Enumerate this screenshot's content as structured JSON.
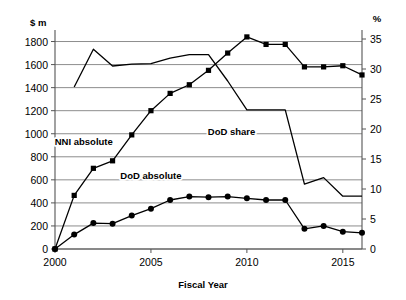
{
  "chart_data": {
    "type": "line",
    "title": "",
    "xlabel": "Fiscal Year",
    "ylabel_left": "$ m",
    "ylabel_right": "%",
    "x": [
      2000,
      2001,
      2002,
      2003,
      2004,
      2005,
      2006,
      2007,
      2008,
      2009,
      2010,
      2011,
      2012,
      2013,
      2014,
      2015,
      2016
    ],
    "xlim": [
      2000,
      2016
    ],
    "xticks": [
      2000,
      2005,
      2010,
      2015
    ],
    "xtick_labels": [
      "2000",
      "2005",
      "2010",
      "2015"
    ],
    "ylim_left": [
      0,
      1900
    ],
    "yticks_left": [
      0,
      200,
      400,
      600,
      800,
      1000,
      1200,
      1400,
      1600,
      1800
    ],
    "ytick_labels_left": [
      "0",
      "200",
      "400",
      "600",
      "800",
      "1000",
      "1200",
      "1400",
      "1600",
      "1800"
    ],
    "ylim_right": [
      0,
      36.5
    ],
    "yticks_right": [
      0,
      5,
      10,
      15,
      20,
      25,
      30,
      35
    ],
    "ytick_labels_right": [
      "0",
      "5",
      "10",
      "15",
      "20",
      "25",
      "30",
      "35"
    ],
    "grid": true,
    "grid_axis": "y-left",
    "legend_position": "inline-annotations",
    "series": [
      {
        "name": "NNI absolute",
        "axis": "left",
        "marker": "square",
        "label_text": "NNI absolute",
        "label_x": 2001.5,
        "label_y": 900,
        "values": [
          0,
          465,
          700,
          765,
          990,
          1200,
          1350,
          1425,
          1550,
          1700,
          1840,
          1775,
          1775,
          1580,
          1580,
          1590,
          1510
        ]
      },
      {
        "name": "DoD absolute",
        "axis": "left",
        "marker": "circle",
        "label_text": "DoD absolute",
        "label_x": 2005.0,
        "label_y": 610,
        "values": [
          0,
          125,
          225,
          220,
          290,
          350,
          425,
          455,
          450,
          455,
          440,
          425,
          425,
          175,
          200,
          150,
          140
        ]
      },
      {
        "name": "DoD share",
        "axis": "right",
        "marker": "none",
        "label_text": "DoD share",
        "label_x": 2009.2,
        "label_y": 19.0,
        "values": [
          null,
          27.0,
          33.3,
          30.5,
          30.8,
          30.9,
          31.8,
          32.4,
          32.4,
          28.0,
          23.2,
          23.2,
          23.2,
          10.8,
          11.9,
          8.8,
          8.8
        ]
      }
    ]
  },
  "axes": {
    "left_unit_label": "$ m",
    "right_unit_label": "%",
    "x_axis_title": "Fiscal Year"
  },
  "annotations": [
    {
      "name": "nni-absolute-label",
      "text": "NNI absolute"
    },
    {
      "name": "dod-absolute-label",
      "text": "DoD absolute"
    },
    {
      "name": "dod-share-label",
      "text": "DoD share"
    }
  ]
}
